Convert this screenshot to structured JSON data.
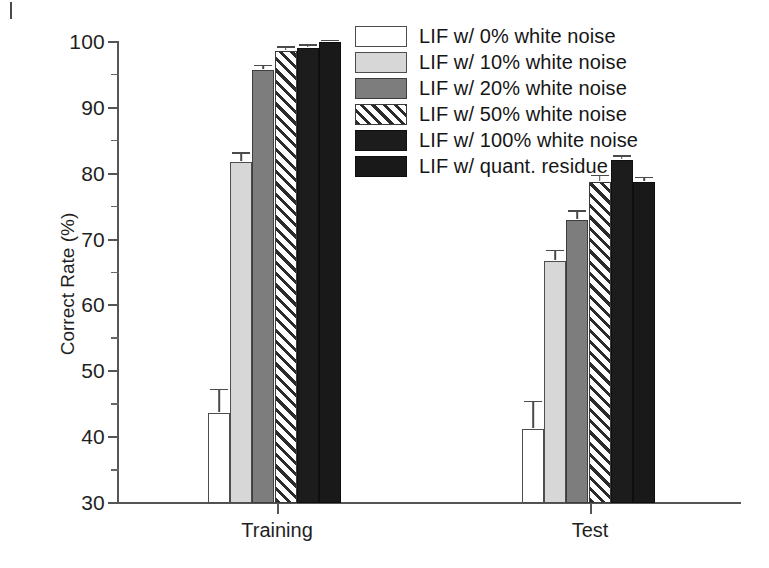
{
  "figure": {
    "ylabel": "Correct Rate (%)",
    "corner_mark": "tick-mark"
  },
  "legend": {
    "items": [
      {
        "label": "LIF w/ 0% white noise",
        "style": "white",
        "color": "#ffffff"
      },
      {
        "label": "LIF w/ 10% white noise",
        "style": "light",
        "color": "#d7d7d7"
      },
      {
        "label": "LIF w/ 20% white noise",
        "style": "mid",
        "color": "#7d7d7d"
      },
      {
        "label": "LIF w/ 50% white noise",
        "style": "hatch",
        "color": "#2b2b2b"
      },
      {
        "label": "LIF w/ 100% white noise",
        "style": "black",
        "color": "#1c1c1c"
      },
      {
        "label": "LIF w/ quant. residue",
        "style": "black2",
        "color": "#191919"
      }
    ]
  },
  "axes": {
    "y_ticks": [
      "100",
      "90",
      "80",
      "70",
      "60",
      "50",
      "40",
      "30"
    ],
    "y_tick_values": [
      100,
      90,
      80,
      70,
      60,
      50,
      40,
      30
    ],
    "y_minor_values": [
      95,
      85,
      75,
      65,
      55,
      45,
      35
    ],
    "x_ticks": [
      "Training",
      "Test"
    ]
  },
  "chart_data": {
    "type": "bar",
    "title": "",
    "xlabel": "",
    "ylabel": "Correct Rate (%)",
    "ylim": [
      30,
      100
    ],
    "grid": false,
    "legend_position": "top-right",
    "categories": [
      "Training",
      "Test"
    ],
    "series": [
      {
        "name": "LIF w/ 0% white noise",
        "values": [
          43.7,
          41.2
        ],
        "errors": [
          3.5,
          4.2
        ]
      },
      {
        "name": "LIF w/ 10% white noise",
        "values": [
          81.8,
          66.8
        ],
        "errors": [
          1.3,
          1.5
        ]
      },
      {
        "name": "LIF w/ 20% white noise",
        "values": [
          95.8,
          73.0
        ],
        "errors": [
          0.6,
          1.3
        ]
      },
      {
        "name": "LIF w/ 50% white noise",
        "values": [
          98.7,
          78.7
        ],
        "errors": [
          0.5,
          1.0
        ]
      },
      {
        "name": "LIF w/ 100% white noise",
        "values": [
          99.1,
          82.1
        ],
        "errors": [
          0.4,
          0.6
        ]
      },
      {
        "name": "LIF w/ quant. residue",
        "values": [
          100.0,
          78.8
        ],
        "errors": [
          0.2,
          0.6
        ]
      }
    ]
  }
}
